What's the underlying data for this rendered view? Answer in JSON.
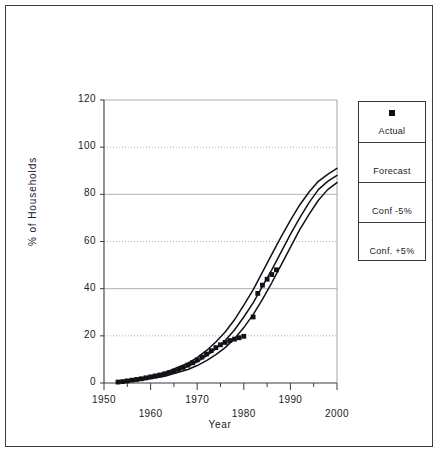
{
  "chart_data": {
    "type": "line",
    "title": "",
    "xlabel": "Year",
    "ylabel": "% of Households",
    "xlim": [
      1950,
      2000
    ],
    "ylim": [
      0,
      120
    ],
    "grid": true,
    "x_ticks": [
      1950,
      1955,
      1960,
      1965,
      1970,
      1975,
      1980,
      1985,
      1990,
      1995,
      2000
    ],
    "x_tick_labels": [
      "1950",
      "1960",
      "1970",
      "1980",
      "1990",
      "2000"
    ],
    "x_labeled_ticks": [
      1950,
      1960,
      1970,
      1980,
      1990,
      2000
    ],
    "y_ticks": [
      0,
      20,
      40,
      60,
      80,
      100,
      120
    ],
    "y_tick_labels": [
      "0",
      "20",
      "40",
      "60",
      "80",
      "100",
      "120"
    ],
    "legend_position": "right",
    "series": [
      {
        "name": "Actual",
        "style": "marker",
        "marker": "square",
        "color": "#111117",
        "x": [
          1953,
          1954,
          1955,
          1956,
          1957,
          1958,
          1959,
          1960,
          1961,
          1962,
          1963,
          1964,
          1965,
          1966,
          1967,
          1968,
          1969,
          1970,
          1971,
          1972,
          1973,
          1974,
          1975,
          1976,
          1977,
          1978,
          1979,
          1980,
          1982,
          1983,
          1984,
          1985,
          1986,
          1987
        ],
        "values": [
          0.4,
          0.6,
          0.9,
          1.2,
          1.5,
          1.8,
          2.2,
          2.6,
          3.0,
          3.4,
          3.9,
          4.4,
          5.0,
          5.8,
          6.6,
          7.6,
          8.6,
          9.8,
          11.0,
          12.3,
          13.7,
          15.0,
          16.2,
          17.2,
          18.0,
          18.6,
          19.2,
          19.8,
          28.0,
          38.0,
          41.5,
          44.0,
          46.0,
          48.0
        ]
      },
      {
        "name": "Forecast",
        "style": "line",
        "color": "#111117",
        "x": [
          1953,
          1958,
          1963,
          1968,
          1970,
          1972,
          1974,
          1976,
          1978,
          1980,
          1982,
          1984,
          1986,
          1988,
          1990,
          1992,
          1994,
          1996,
          1998,
          2000
        ],
        "values": [
          0.3,
          1.6,
          3.6,
          7.0,
          9.0,
          11.5,
          14.5,
          18.0,
          22.5,
          28.0,
          34.0,
          41.0,
          48.0,
          55.5,
          63.0,
          70.0,
          76.5,
          82.0,
          85.5,
          88.0
        ]
      },
      {
        "name": "Conf -5%",
        "style": "line",
        "color": "#111117",
        "x": [
          1953,
          1958,
          1963,
          1968,
          1970,
          1972,
          1974,
          1976,
          1978,
          1980,
          1982,
          1984,
          1986,
          1988,
          1990,
          1992,
          1994,
          1996,
          1998,
          2000
        ],
        "values": [
          0.4,
          2.0,
          4.4,
          8.4,
          10.8,
          13.8,
          17.4,
          21.6,
          26.8,
          33.0,
          39.5,
          47.0,
          54.5,
          62.0,
          69.0,
          75.5,
          81.0,
          85.5,
          88.5,
          91.0
        ]
      },
      {
        "name": "Conf. +5%",
        "style": "line",
        "color": "#111117",
        "x": [
          1953,
          1958,
          1963,
          1968,
          1970,
          1972,
          1974,
          1976,
          1978,
          1980,
          1982,
          1984,
          1986,
          1988,
          1990,
          1992,
          1994,
          1996,
          1998,
          2000
        ],
        "values": [
          0.2,
          1.2,
          2.9,
          5.7,
          7.4,
          9.5,
          12.0,
          15.0,
          18.8,
          23.5,
          29.0,
          35.5,
          42.5,
          50.0,
          57.5,
          65.0,
          71.5,
          77.5,
          82.0,
          85.0
        ]
      }
    ]
  },
  "legend": {
    "entries": [
      {
        "label": "Actual",
        "sample": "square-marker"
      },
      {
        "label": "Forecast",
        "sample": "line"
      },
      {
        "label": "Conf -5%",
        "sample": "line"
      },
      {
        "label": "Conf. +5%",
        "sample": "line"
      }
    ]
  },
  "colors": {
    "ink": "#111117",
    "frame": "#3a3a40",
    "grid": "#9a9aa2",
    "background": "#ffffff"
  }
}
